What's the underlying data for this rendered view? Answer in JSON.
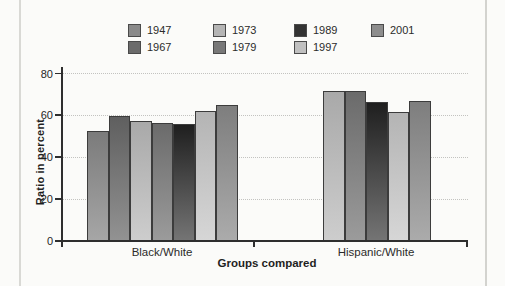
{
  "chart_data": {
    "type": "bar",
    "title": "",
    "xlabel": "Groups compared",
    "ylabel": "Ratio in percent",
    "ylim": [
      0,
      80
    ],
    "yticks": [
      "0",
      "20",
      "40",
      "60",
      "80"
    ],
    "grid": "horizontal-dotted",
    "legend_position": "top",
    "categories": [
      "Black/White",
      "Hispanic/White"
    ],
    "series": [
      {
        "name": "1947",
        "values": [
          52,
          null
        ],
        "swatch": "#8a8a8a",
        "color_top": "#7b7b7b",
        "color_bottom": "#a6a6a6"
      },
      {
        "name": "1967",
        "values": [
          59,
          null
        ],
        "swatch": "#6b6b6b",
        "color_top": "#5f5f5f",
        "color_bottom": "#929292"
      },
      {
        "name": "1973",
        "values": [
          57,
          71
        ],
        "swatch": "#b5b5b5",
        "color_top": "#a9a9a9",
        "color_bottom": "#cdcdcd"
      },
      {
        "name": "1979",
        "values": [
          56,
          71
        ],
        "swatch": "#787878",
        "color_top": "#6b6b6b",
        "color_bottom": "#9b9b9b"
      },
      {
        "name": "1989",
        "values": [
          55.5,
          66
        ],
        "swatch": "#333333",
        "color_top": "#1f1f1f",
        "color_bottom": "#747474"
      },
      {
        "name": "1997",
        "values": [
          61.5,
          61
        ],
        "swatch": "#c0c0c0",
        "color_top": "#b4b4b4",
        "color_bottom": "#d6d6d6"
      },
      {
        "name": "2001",
        "values": [
          64.5,
          66.5
        ],
        "swatch": "#8d8d8d",
        "color_top": "#7e7e7e",
        "color_bottom": "#ababab"
      }
    ],
    "axis_color": "#2e2e2e",
    "gridline_color": "#c3c3c0"
  }
}
